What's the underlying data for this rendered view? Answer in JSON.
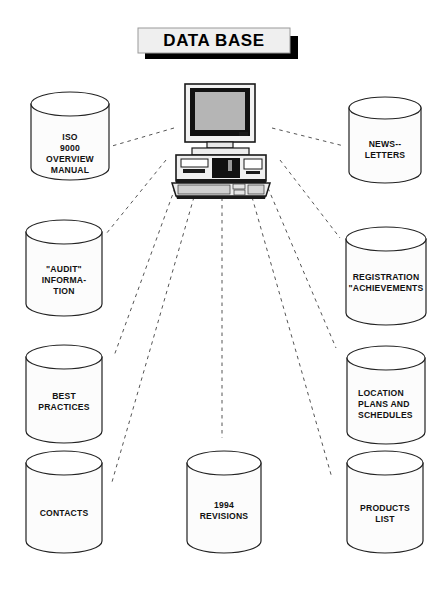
{
  "title": {
    "label": "DATA BASE"
  },
  "center_node": {
    "name": "desktop-computer",
    "parts": [
      "monitor",
      "system-unit",
      "keyboard"
    ]
  },
  "colors": {
    "ink": "#111111",
    "outline": "#222222",
    "cylinder_fill": "#fcfcfc",
    "cylinder_top_fill": "#ffffff",
    "screen": "#b5b5b5",
    "shadow": "#000000",
    "title_fill": "#efefef",
    "background": "#ffffff"
  },
  "nodes": [
    {
      "id": "iso-9000-overview-manual",
      "lines": [
        "ISO",
        "9000",
        "OVERVIEW",
        "MANUAL"
      ],
      "align": "center",
      "cx": 70,
      "top": 104,
      "rx": 39,
      "ry": 12,
      "body_h": 64,
      "text_y": 140
    },
    {
      "id": "newsletters",
      "lines": [
        "NEWS--",
        "LETTERS"
      ],
      "align": "center",
      "cx": 385,
      "top": 108,
      "rx": 36,
      "ry": 11,
      "body_h": 64,
      "text_y": 147
    },
    {
      "id": "audit-information",
      "lines": [
        "\"AUDIT\"",
        "INFORMA-",
        "TION"
      ],
      "align": "center",
      "cx": 64,
      "top": 232,
      "rx": 38,
      "ry": 12,
      "body_h": 72,
      "text_y": 272
    },
    {
      "id": "registration-achievements",
      "lines": [
        "REGISTRATION",
        "\"ACHIEVEMENTS"
      ],
      "align": "center",
      "cx": 386,
      "top": 239,
      "rx": 40,
      "ry": 12,
      "body_h": 74,
      "text_y": 280
    },
    {
      "id": "best-practices",
      "lines": [
        "BEST",
        "PRACTICES"
      ],
      "align": "center",
      "cx": 64,
      "top": 357,
      "rx": 38,
      "ry": 12,
      "body_h": 74,
      "text_y": 399
    },
    {
      "id": "location-plans-and-schedules",
      "lines": [
        "LOCATION",
        "PLANS AND",
        "SCHEDULES"
      ],
      "align": "left",
      "cx": 386,
      "top": 358,
      "rx": 39,
      "ry": 12,
      "body_h": 74,
      "text_y": 396,
      "text_x": 358
    },
    {
      "id": "contacts",
      "lines": [
        "CONTACTS"
      ],
      "align": "center",
      "cx": 64,
      "top": 463,
      "rx": 38,
      "ry": 12,
      "body_h": 78,
      "text_y": 516
    },
    {
      "id": "1994-revisions",
      "lines": [
        "1994",
        "REVISIONS"
      ],
      "align": "center",
      "cx": 224,
      "top": 463,
      "rx": 37,
      "ry": 12,
      "body_h": 78,
      "text_y": 508
    },
    {
      "id": "products-list",
      "lines": [
        "PRODUCTS",
        "LIST"
      ],
      "align": "center",
      "cx": 385,
      "top": 463,
      "rx": 38,
      "ry": 12,
      "body_h": 78,
      "text_y": 511
    }
  ],
  "connectors": [
    {
      "id": "link-iso-9000-overview-manual",
      "x1": 174,
      "y1": 128,
      "x2": 112,
      "y2": 146
    },
    {
      "id": "link-newsletters",
      "x1": 272,
      "y1": 128,
      "x2": 344,
      "y2": 146
    },
    {
      "id": "link-audit-information",
      "x1": 166,
      "y1": 160,
      "x2": 106,
      "y2": 234
    },
    {
      "id": "link-registration-achievements",
      "x1": 280,
      "y1": 160,
      "x2": 340,
      "y2": 238
    },
    {
      "id": "link-best-practices",
      "x1": 175,
      "y1": 188,
      "x2": 114,
      "y2": 356
    },
    {
      "id": "link-location-plans-and-schedules",
      "x1": 268,
      "y1": 188,
      "x2": 336,
      "y2": 348
    },
    {
      "id": "link-contacts",
      "x1": 196,
      "y1": 190,
      "x2": 112,
      "y2": 482
    },
    {
      "id": "link-1994-revisions",
      "x1": 222,
      "y1": 190,
      "x2": 222,
      "y2": 438
    },
    {
      "id": "link-products-list",
      "x1": 250,
      "y1": 190,
      "x2": 332,
      "y2": 478
    }
  ]
}
